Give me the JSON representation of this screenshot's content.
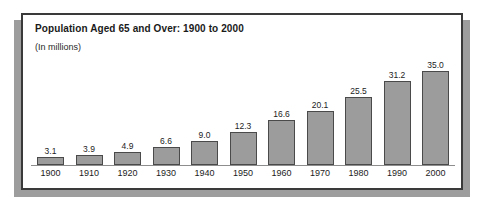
{
  "chart_data": {
    "type": "bar",
    "title": "Population Aged 65 and Over: 1900 to 2000",
    "subtitle": "(In millions)",
    "xlabel": "",
    "ylabel": "",
    "ylim": [
      0,
      35.0
    ],
    "grid": false,
    "legend": null,
    "bar_color": "#9c9c9c",
    "bar_border_color": "#4a4a4a",
    "categories": [
      "1900",
      "1910",
      "1920",
      "1930",
      "1940",
      "1950",
      "1960",
      "1970",
      "1980",
      "1990",
      "2000"
    ],
    "values": [
      3.1,
      3.9,
      4.9,
      6.6,
      9.0,
      12.3,
      16.6,
      20.1,
      25.5,
      31.2,
      35.0
    ],
    "value_labels": [
      "3.1",
      "3.9",
      "4.9",
      "6.6",
      "9.0",
      "12.3",
      "16.6",
      "20.1",
      "25.5",
      "31.2",
      "35.0"
    ]
  }
}
